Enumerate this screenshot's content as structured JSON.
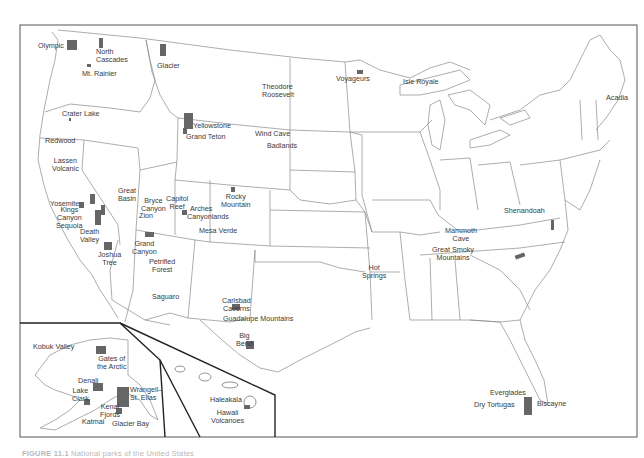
{
  "map": {
    "title": "National parks of the United States",
    "colors": {
      "park_fill": "#666666",
      "border": "#8a8a8a",
      "frame": "#333333",
      "label": "#3a3a3a",
      "caption": "#b8b8b8"
    },
    "insets": [
      "Alaska",
      "Hawaii"
    ],
    "parks": {
      "olympic": "Olympic",
      "north_cascades": "North\nCascades",
      "mt_rainier": "Mt. Rainier",
      "glacier": "Glacier",
      "crater_lake": "Crater Lake",
      "redwood": "Redwood",
      "lassen_volcanic": "Lassen\nVolcanic",
      "yosemite": "Yosemite",
      "kings_canyon": "Kings\nCanyon",
      "sequoia": "Sequoia",
      "death_valley": "Death\nValley",
      "joshua_tree": "Joshua\nTree",
      "great_basin": "Great\nBasin",
      "bryce_canyon": "Bryce\nCanyon",
      "zion": "Zion",
      "capitol_reef": "Capitol\nReef",
      "arches": "Arches",
      "canyonlands": "Canyonlands",
      "mesa_verde": "Mesa Verde",
      "rocky_mountain": "Rocky\nMountain",
      "grand_canyon": "Grand\nCanyon",
      "petrified_forest": "Petrified\nForest",
      "saguaro": "Saguaro",
      "yellowstone": "Yellowstone",
      "grand_teton": "Grand Teton",
      "theodore_roosevelt": "Theodore\nRoosevelt",
      "wind_cave": "Wind Cave",
      "badlands": "Badlands",
      "carlsbad_caverns": "Carlsbad\nCaverns",
      "guadalupe_mountains": "Guadalupe Mountains",
      "big_bend": "Big\nBend",
      "voyageurs": "Voyageurs",
      "isle_royale": "Isle Royale",
      "acadia": "Acadia",
      "hot_springs": "Hot\nSprings",
      "mammoth_cave": "Mammoth\nCave",
      "shenandoah": "Shenandoah",
      "great_smoky_mountains": "Great Smoky\nMountains",
      "everglades": "Everglades",
      "biscayne": "Biscayne",
      "dry_tortugas": "Dry Tortugas",
      "kobuk_valley": "Kobuk Valley",
      "gates_of_the_arctic": "Gates of\nthe Arctic",
      "denali": "Denali",
      "lake_clark": "Lake\nClark",
      "wrangell_st_elias": "Wrangell–\nSt. Elias",
      "kenai_fjords": "Kenai\nFjords",
      "katmai": "Katmai",
      "glacier_bay": "Glacier Bay",
      "haleakala": "Haleakala",
      "hawaii_volcanoes": "Hawaii\nVolcanoes"
    }
  },
  "caption": {
    "figure_number": "FIGURE 11.1",
    "text": "National parks of the United States"
  }
}
